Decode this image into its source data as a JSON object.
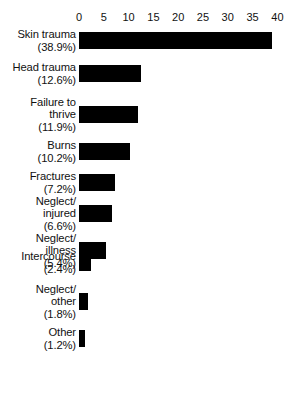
{
  "chart_data": {
    "type": "bar",
    "orientation": "horizontal",
    "title": "",
    "xlabel": "",
    "ylabel": "",
    "xlim": [
      0,
      40
    ],
    "grid": false,
    "legend": null,
    "axis_position": "top",
    "bar_color": "#000000",
    "background_color": "#ffffff",
    "tick_values": [
      0,
      5,
      10,
      15,
      20,
      25,
      30,
      35,
      40
    ],
    "tick_labels": [
      "0",
      "5",
      "10",
      "15",
      "20",
      "25",
      "30",
      "35",
      "40"
    ],
    "categories": [
      "Skin trauma",
      "Head trauma",
      "Failure to\nthrive",
      "Burns",
      "Fractures",
      "Neglect/\ninjured",
      "Neglect/\nillness",
      "Intercourse",
      "Neglect/\nother",
      "Other"
    ],
    "value_labels": [
      "(38.9%)",
      "(12.6%)",
      "(11.9%)",
      "(10.2%)",
      "(7.2%)",
      "(6.6%)",
      "(5.4%)",
      "(2.4%)",
      "(1.8%)",
      "(1.2%)"
    ],
    "values": [
      38.9,
      12.6,
      11.9,
      10.2,
      7.2,
      6.6,
      5.4,
      2.4,
      1.8,
      1.2
    ],
    "units": "percent"
  },
  "geometry": {
    "plot_left_px": 79,
    "px_per_unit": 4.96,
    "bar_height_px": 17,
    "row_tops_px": [
      32,
      65,
      106,
      143,
      174,
      205,
      242,
      254,
      293,
      330
    ]
  }
}
